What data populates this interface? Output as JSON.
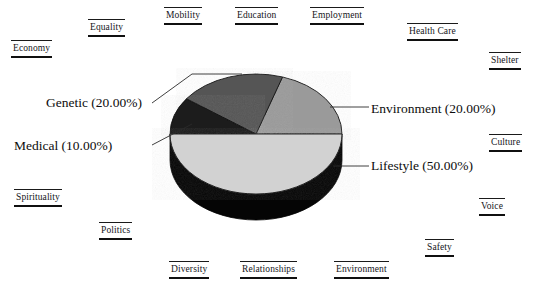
{
  "figure": {
    "title": "",
    "background_color": "#ffffff",
    "text_color": "#111111"
  },
  "chart_data": {
    "type": "pie",
    "title": "",
    "three_d": true,
    "start_angle_deg": 0,
    "direction": "counterclockwise",
    "labels": [
      "Environment",
      "Genetic",
      "Medical",
      "Lifestyle"
    ],
    "values": [
      20.0,
      20.0,
      10.0,
      50.0
    ],
    "value_unit": "%",
    "colors": [
      "#9a9a9a",
      "#555555",
      "#1b1b1b",
      "#d2d2d2"
    ],
    "side_wall_color": "#050505",
    "legend": "none",
    "annotations": [
      {
        "text": "Genetic (20.00%)",
        "slice": "Genetic",
        "side": "left"
      },
      {
        "text": "Medical (10.00%)",
        "slice": "Medical",
        "side": "left"
      },
      {
        "text": "Environment (20.00%)",
        "slice": "Environment",
        "side": "right"
      },
      {
        "text": "Lifestyle (50.00%)",
        "slice": "Lifestyle",
        "side": "right"
      }
    ],
    "slices": [
      {
        "label": "Environment",
        "percent": "20.00%",
        "value": 20.0,
        "color": "#9a9a9a",
        "callout": "Environment (20.00%)"
      },
      {
        "label": "Genetic",
        "percent": "20.00%",
        "value": 20.0,
        "color": "#555555",
        "callout": "Genetic (20.00%)"
      },
      {
        "label": "Medical",
        "percent": "10.00%",
        "value": 10.0,
        "color": "#1b1b1b",
        "callout": "Medical (10.00%)"
      },
      {
        "label": "Lifestyle",
        "percent": "50.00%",
        "value": 50.0,
        "color": "#d2d2d2",
        "callout": "Lifestyle (50.00%)"
      }
    ]
  },
  "callouts": {
    "genetic": "Genetic (20.00%)",
    "medical": "Medical (10.00%)",
    "environment": "Environment (20.00%)",
    "lifestyle": "Lifestyle (50.00%)"
  },
  "background_labels": [
    {
      "text": "Equality",
      "x": 88,
      "y": 19
    },
    {
      "text": "Mobility",
      "x": 164,
      "y": 7
    },
    {
      "text": "Education",
      "x": 235,
      "y": 7
    },
    {
      "text": "Employment",
      "x": 310,
      "y": 7
    },
    {
      "text": "Health Care",
      "x": 407,
      "y": 23
    },
    {
      "text": "Economy",
      "x": 11,
      "y": 40
    },
    {
      "text": "Shelter",
      "x": 489,
      "y": 52
    },
    {
      "text": "Culture",
      "x": 489,
      "y": 134
    },
    {
      "text": "Spirituality",
      "x": 14,
      "y": 189
    },
    {
      "text": "Voice",
      "x": 479,
      "y": 198
    },
    {
      "text": "Politics",
      "x": 99,
      "y": 222
    },
    {
      "text": "Safety",
      "x": 425,
      "y": 239
    },
    {
      "text": "Diversity",
      "x": 169,
      "y": 261
    },
    {
      "text": "Relationships",
      "x": 240,
      "y": 261
    },
    {
      "text": "Environment",
      "x": 334,
      "y": 261
    }
  ]
}
